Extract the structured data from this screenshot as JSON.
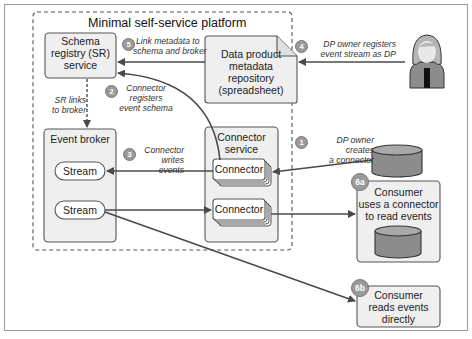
{
  "title": "Minimal self-service platform",
  "nodes": {
    "schema_registry": "Schema registry (SR) service",
    "schema_registry_lines": [
      "Schema",
      "registry (SR)",
      "service"
    ],
    "data_product_repo_lines": [
      "Data product",
      "metadata",
      "repository",
      "(spreadsheet)"
    ],
    "event_broker": "Event broker",
    "stream_1": "Stream",
    "stream_2": "Stream",
    "connector_service_lines": [
      "Connector",
      "service"
    ],
    "connector_1": "Connector",
    "connector_2": "Connector",
    "consumer_6a_lines": [
      "Consumer",
      "uses a connector",
      "to read events"
    ],
    "consumer_6b_lines": [
      "Consumer",
      "reads events",
      "directly"
    ]
  },
  "annotations": {
    "sr_links": [
      "SR links",
      "to broker"
    ],
    "step1": {
      "badge": "1",
      "lines": [
        "DP owner creates",
        "a connector"
      ]
    },
    "step2": {
      "badge": "2",
      "lines": [
        "Connector",
        "registers",
        "event schema"
      ]
    },
    "step3": {
      "badge": "3",
      "lines": [
        "Connector",
        "writes events"
      ]
    },
    "step4": {
      "badge": "4",
      "lines": [
        "DP owner registers",
        "event stream as DP"
      ]
    },
    "step5": {
      "badge": "5",
      "lines": [
        "Link metadata to",
        "schema and broker"
      ]
    },
    "step6a": {
      "badge": "6a"
    },
    "step6b": {
      "badge": "6b"
    }
  },
  "colors": {
    "box_fill": "#efefef",
    "box_stroke": "#555555",
    "arrow": "#4a4a4a",
    "badge": "#9a9a9a",
    "cylinder": "#8c8c8c",
    "dashed": "#555555"
  }
}
